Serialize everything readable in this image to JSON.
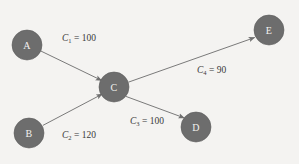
{
  "diagram": {
    "type": "directed-graph",
    "title": "",
    "background_color": "#f4f3f1",
    "node_color": "#6d6d6d",
    "node_label_color": "#f2f1ef",
    "edge_color": "#7a7a7a",
    "label_text_color": "#3a3a3a",
    "nodes": [
      {
        "id": "A",
        "label": "A",
        "cx": 27,
        "cy": 45,
        "r": 15
      },
      {
        "id": "B",
        "label": "B",
        "cx": 29,
        "cy": 133,
        "r": 15
      },
      {
        "id": "C",
        "label": "C",
        "cx": 114,
        "cy": 87,
        "r": 15
      },
      {
        "id": "D",
        "label": "D",
        "cx": 196,
        "cy": 127,
        "r": 15
      },
      {
        "id": "E",
        "label": "E",
        "cx": 269,
        "cy": 30,
        "r": 15
      }
    ],
    "edges": [
      {
        "id": "C1",
        "from": "A",
        "to": "C",
        "symbol": "C",
        "subscript": "1",
        "equals": "=",
        "value": "100",
        "label_text": "C1 = 100",
        "label_x": 62,
        "label_y": 34
      },
      {
        "id": "C2",
        "from": "B",
        "to": "C",
        "symbol": "C",
        "subscript": "2",
        "equals": "=",
        "value": "120",
        "label_text": "C2 = 120",
        "label_x": 62,
        "label_y": 131
      },
      {
        "id": "C3",
        "from": "C",
        "to": "D",
        "symbol": "C",
        "subscript": "3",
        "equals": "=",
        "value": "100",
        "label_text": "C3 = 100",
        "label_x": 130,
        "label_y": 117
      },
      {
        "id": "C4",
        "from": "C",
        "to": "E",
        "symbol": "C",
        "subscript": "4",
        "equals": "=",
        "value": "90",
        "label_text": "C4 = 90",
        "label_x": 197,
        "label_y": 66
      }
    ]
  }
}
